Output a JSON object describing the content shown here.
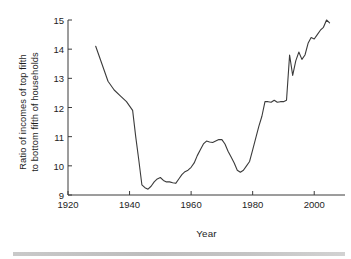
{
  "chart_data": {
    "type": "line",
    "title": "",
    "xlabel": "Year",
    "ylabel": "Ratio of incomes of top fifth to bottom fifth of households",
    "ylabel_lines": [
      "Ratio of incomes of top fifth",
      "to bottom fifth of households"
    ],
    "xlim": [
      1920,
      2010
    ],
    "ylim": [
      9,
      15
    ],
    "grid": false,
    "legend": null,
    "xticks": [
      1920,
      1940,
      1960,
      1980,
      2000
    ],
    "xtick_labels": [
      "1920",
      "1940",
      "1960",
      "1980",
      "2000"
    ],
    "yticks": [
      9,
      10,
      11,
      12,
      13,
      14,
      15
    ],
    "ytick_labels": [
      "9",
      "10",
      "11",
      "12",
      "13",
      "14",
      "15"
    ],
    "line_color": "#3b3b3b",
    "series": [
      {
        "name": "Ratio of incomes of top fifth to bottom fifth of households",
        "x": [
          1929,
          1931,
          1933,
          1935,
          1937,
          1939,
          1941,
          1942,
          1943,
          1944,
          1945,
          1946,
          1947,
          1948,
          1949,
          1950,
          1951,
          1952,
          1953,
          1954,
          1955,
          1956,
          1957,
          1958,
          1959,
          1960,
          1961,
          1962,
          1963,
          1964,
          1965,
          1966,
          1967,
          1968,
          1969,
          1970,
          1971,
          1972,
          1973,
          1974,
          1975,
          1976,
          1977,
          1978,
          1979,
          1980,
          1981,
          1982,
          1983,
          1984,
          1985,
          1986,
          1987,
          1988,
          1989,
          1990,
          1991,
          1992,
          1993,
          1994,
          1995,
          1996,
          1997,
          1998,
          1999,
          2000,
          2001,
          2002,
          2003,
          2004,
          2005
        ],
        "y": [
          14.1,
          13.5,
          12.9,
          12.6,
          12.4,
          12.2,
          11.9,
          11.0,
          10.2,
          9.35,
          9.25,
          9.2,
          9.3,
          9.45,
          9.55,
          9.6,
          9.5,
          9.45,
          9.45,
          9.42,
          9.4,
          9.55,
          9.7,
          9.8,
          9.85,
          9.95,
          10.1,
          10.35,
          10.55,
          10.75,
          10.85,
          10.82,
          10.8,
          10.85,
          10.9,
          10.9,
          10.75,
          10.5,
          10.3,
          10.1,
          9.85,
          9.78,
          9.85,
          10.0,
          10.15,
          10.55,
          10.95,
          11.35,
          11.7,
          12.2,
          12.2,
          12.18,
          12.25,
          12.18,
          12.2,
          12.2,
          12.25,
          13.8,
          13.1,
          13.6,
          13.9,
          13.65,
          13.8,
          14.2,
          14.4,
          14.35,
          14.5,
          14.65,
          14.75,
          15.0,
          14.9
        ]
      }
    ]
  },
  "axis": {
    "ylabel_line1": "Ratio of incomes of top fifth",
    "ylabel_line2": "to bottom fifth of households",
    "xlabel": "Year"
  }
}
